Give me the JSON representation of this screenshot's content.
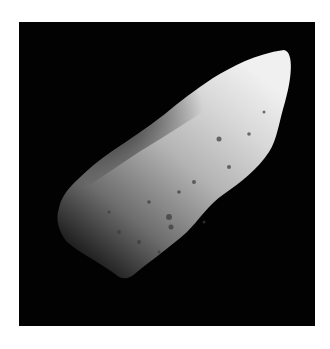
{
  "image": {
    "subject": "asteroid",
    "description": "Cratered, elongated asteroid lit from the upper right against black space",
    "background_color": "#ffffff",
    "space_color": "#020202"
  }
}
